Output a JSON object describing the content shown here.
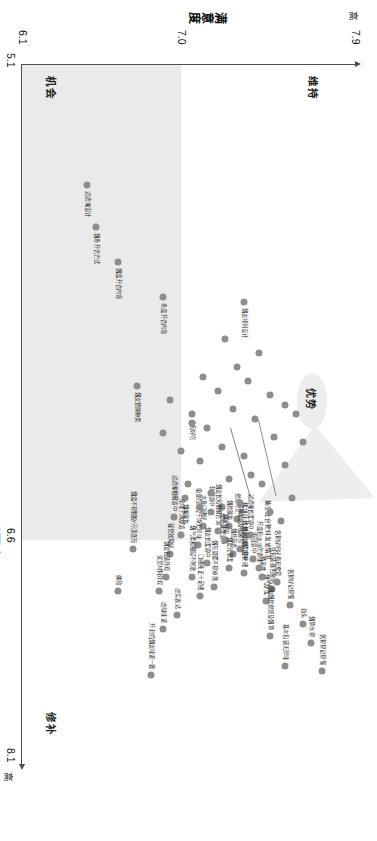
{
  "chart_data": {
    "type": "scatter",
    "title": "",
    "xlabel": "重要度",
    "ylabel": "满意度",
    "xlim": [
      5.1,
      8.1
    ],
    "ylim": [
      6.1,
      7.9
    ],
    "x_ticks": [
      "5.1",
      "6.6",
      "8.1"
    ],
    "y_ticks": [
      "6.1",
      "7.0",
      "7.9"
    ],
    "x_axis_end_label": "高",
    "y_axis_end_label": "高",
    "grid": false,
    "legend": "none",
    "quadrants": [
      {
        "name": "维持",
        "position": "top-left"
      },
      {
        "name": "优势",
        "position": "top-right"
      },
      {
        "name": "机会",
        "position": "bottom-left"
      },
      {
        "name": "修补",
        "position": "bottom-right"
      }
    ],
    "highlight_cluster_label": "优势",
    "callouts": [
      "抽空灶台物料发放情况",
      "烤饼叶烤炉烤饼情况"
    ],
    "labeled_points": [
      {
        "label": "过滤嘴设计",
        "x": 5.62,
        "y": 6.45
      },
      {
        "label": "烟条开合方式",
        "x": 5.8,
        "y": 6.5
      },
      {
        "label": "烟盒开合内容",
        "x": 5.95,
        "y": 6.62
      },
      {
        "label": "条盒开合内容",
        "x": 6.1,
        "y": 6.86
      },
      {
        "label": "烟支排列设计",
        "x": 6.12,
        "y": 7.3
      },
      {
        "label": "烟支替换种类",
        "x": 6.48,
        "y": 6.72
      },
      {
        "label": "小包好吃",
        "x": 6.6,
        "y": 7.02
      },
      {
        "label": "烟盒不易脱胶/污渍变形",
        "x": 7.18,
        "y": 6.7
      },
      {
        "label": "名称易记易懂",
        "x": 7.7,
        "y": 7.72
      },
      {
        "label": "烟草水帘",
        "x": 7.58,
        "y": 7.66
      },
      {
        "label": "劲头",
        "x": 7.5,
        "y": 7.62
      },
      {
        "label": "名称好记易懂",
        "x": 7.42,
        "y": 7.55
      },
      {
        "label": "基本包装无异味",
        "x": 7.68,
        "y": 7.52
      },
      {
        "label": "外包装颜色鲜艳",
        "x": 7.35,
        "y": 7.45
      },
      {
        "label": "名称好听好看有寓意",
        "x": 7.32,
        "y": 7.48
      },
      {
        "label": "烟气舒度",
        "x": 7.4,
        "y": 7.42
      },
      {
        "label": "精美性",
        "x": 7.3,
        "y": 7.4
      },
      {
        "label": "吸阻适中",
        "x": 7.22,
        "y": 7.35
      },
      {
        "label": "开盒有淡淡的香味",
        "x": 7.26,
        "y": 7.38
      },
      {
        "label": "火/烟/烟丝燃烧及烟草",
        "x": 7.55,
        "y": 7.44
      },
      {
        "label": "过滤嘴长度适中",
        "x": 7.12,
        "y": 7.33
      },
      {
        "label": "燃烧均匀",
        "x": 7.05,
        "y": 7.26
      },
      {
        "label": "烟丝颜色",
        "x": 7.08,
        "y": 7.22
      },
      {
        "label": "提神醒脑舒缓疲劳",
        "x": 7.18,
        "y": 7.28
      },
      {
        "label": "燃烧速度适中",
        "x": 7.0,
        "y": 7.18
      },
      {
        "label": "软硬适中",
        "x": 7.02,
        "y": 7.12
      },
      {
        "label": "烟支长短粗细合适",
        "x": 7.1,
        "y": 7.16
      },
      {
        "label": "烟支有咽口舒畅感",
        "x": 7.28,
        "y": 7.3
      },
      {
        "label": "烟丝形态",
        "x": 7.2,
        "y": 7.24
      },
      {
        "label": "烟支外观",
        "x": 7.14,
        "y": 7.2
      },
      {
        "label": "烟支光滑度",
        "x": 7.26,
        "y": 7.22
      },
      {
        "label": "烟灰凝聚不易掉落",
        "x": 7.34,
        "y": 7.14
      },
      {
        "label": "本身口感好",
        "x": 7.08,
        "y": 7.08
      },
      {
        "label": "吸食后口腔干净无异味",
        "x": 7.16,
        "y": 7.05
      },
      {
        "label": "烟支长度适中",
        "x": 7.24,
        "y": 7.1
      },
      {
        "label": "烟气柔和细腻不刺激",
        "x": 7.3,
        "y": 7.02
      },
      {
        "label": "烟嘴颜色",
        "x": 6.96,
        "y": 6.98
      },
      {
        "label": "过滤嘴粗细适中",
        "x": 7.04,
        "y": 6.92
      },
      {
        "label": "余味干净舒适",
        "x": 7.12,
        "y": 6.96
      },
      {
        "label": "口感纯正十足感",
        "x": 7.38,
        "y": 7.06
      },
      {
        "label": "视觉效果好",
        "x": 7.2,
        "y": 6.9
      },
      {
        "label": "烟支包装外观",
        "x": 7.3,
        "y": 6.88
      },
      {
        "label": "虚实表达",
        "x": 7.46,
        "y": 6.94
      },
      {
        "label": "奖赏材料外观",
        "x": 7.36,
        "y": 6.84
      },
      {
        "label": "体验",
        "x": 7.36,
        "y": 6.62
      },
      {
        "label": "开封后烟支味道一致",
        "x": 7.72,
        "y": 6.8
      },
      {
        "label": "虚拟味道",
        "x": 7.52,
        "y": 6.86
      }
    ],
    "unlabeled_point_count": 32
  },
  "axes": {
    "x_name": "重要度",
    "y_name": "满意度",
    "x_high": "高",
    "y_high": "高",
    "x_min": "5.1",
    "x_mid": "6.6",
    "x_max": "8.1",
    "y_min": "6.1",
    "y_mid": "7.0",
    "y_max": "7.9"
  },
  "quadrant_labels": {
    "maintain": "维持",
    "advantage": "优势",
    "opportunity": "机会",
    "repair": "修补"
  },
  "cluster": {
    "label": "优势"
  },
  "callout_a": "抽空灶台物料发放情况",
  "callout_b": "烤饼叶烤炉烤饼情况"
}
